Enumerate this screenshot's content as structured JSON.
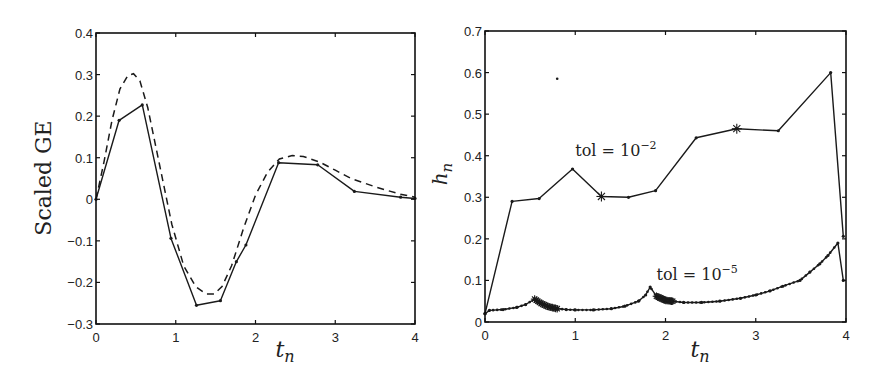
{
  "chart_data": [
    {
      "type": "line",
      "title": "",
      "xlabel": "t_n",
      "ylabel": "Scaled GE",
      "xlim": [
        0,
        4
      ],
      "ylim": [
        -0.3,
        0.4
      ],
      "xticks": [
        0,
        1,
        2,
        3,
        4
      ],
      "yticks": [
        -0.3,
        -0.2,
        -0.1,
        0,
        0.1,
        0.2,
        0.3,
        0.4
      ],
      "xtick_labels": [
        "0",
        "1",
        "2",
        "3",
        "4"
      ],
      "ytick_labels": [
        "−0.3",
        "−0.2",
        "−0.1",
        "0",
        "0.1",
        "0.2",
        "0.3",
        "0.4"
      ],
      "grid": false,
      "legend": null,
      "series": [
        {
          "name": "computed (solid)",
          "style": "solid-with-dots",
          "x": [
            0,
            0.29,
            0.58,
            0.94,
            1.26,
            1.56,
            1.76,
            1.88,
            2.29,
            2.78,
            3.24,
            3.82,
            4.0
          ],
          "y": [
            0.0,
            0.19,
            0.227,
            -0.094,
            -0.255,
            -0.244,
            -0.15,
            -0.11,
            0.088,
            0.083,
            0.019,
            0.005,
            0.002
          ]
        },
        {
          "name": "reference (dashed)",
          "style": "dashed",
          "x": [
            0,
            0.1,
            0.2,
            0.3,
            0.4,
            0.47,
            0.55,
            0.65,
            0.8,
            0.95,
            1.1,
            1.25,
            1.38,
            1.48,
            1.58,
            1.7,
            1.85,
            2.0,
            2.15,
            2.3,
            2.46,
            2.6,
            2.8,
            3.0,
            3.2,
            3.5,
            3.8,
            4.0
          ],
          "y": [
            0.0,
            0.09,
            0.19,
            0.265,
            0.298,
            0.302,
            0.285,
            0.22,
            0.08,
            -0.06,
            -0.16,
            -0.21,
            -0.228,
            -0.228,
            -0.21,
            -0.16,
            -0.07,
            0.01,
            0.065,
            0.097,
            0.105,
            0.103,
            0.09,
            0.07,
            0.05,
            0.03,
            0.013,
            0.005
          ]
        }
      ]
    },
    {
      "type": "line",
      "title": "",
      "xlabel": "t_n",
      "ylabel": "h_n",
      "xlim": [
        0,
        4
      ],
      "ylim": [
        0,
        0.7
      ],
      "xticks": [
        0,
        1,
        2,
        3,
        4
      ],
      "yticks": [
        0,
        0.1,
        0.2,
        0.3,
        0.4,
        0.5,
        0.6,
        0.7
      ],
      "xtick_labels": [
        "0",
        "1",
        "2",
        "3",
        "4"
      ],
      "ytick_labels": [
        "0",
        "0.1",
        "0.2",
        "0.3",
        "0.4",
        "0.5",
        "0.6",
        "0.7"
      ],
      "grid": false,
      "legend": null,
      "annotations": [
        {
          "text": "tol = 10",
          "exp": "−2",
          "x": 1.0,
          "y": 0.4
        },
        {
          "text": "tol = 10",
          "exp": "−5",
          "x": 1.9,
          "y": 0.1
        }
      ],
      "series": [
        {
          "name": "tol = 1e-2",
          "style": "solid-with-dots",
          "x": [
            0,
            0.3,
            0.6,
            0.97,
            1.29,
            1.59,
            1.89,
            2.34,
            2.79,
            3.25,
            3.83,
            3.97
          ],
          "y": [
            0.02,
            0.29,
            0.297,
            0.368,
            0.302,
            0.3,
            0.316,
            0.443,
            0.465,
            0.46,
            0.6,
            0.206
          ],
          "rejected_steps_at": [
            1.29,
            2.79
          ]
        },
        {
          "name": "tol = 1e-5",
          "style": "solid-with-dots",
          "x": [
            0,
            0.05,
            0.2,
            0.35,
            0.45,
            0.55,
            0.62,
            0.7,
            0.8,
            0.9,
            1.0,
            1.2,
            1.4,
            1.55,
            1.7,
            1.78,
            1.83,
            1.9,
            2.0,
            2.08,
            2.2,
            2.4,
            2.6,
            2.83,
            3.0,
            3.16,
            3.3,
            3.49,
            3.6,
            3.71,
            3.8,
            3.91,
            3.97
          ],
          "y": [
            0.02,
            0.028,
            0.03,
            0.035,
            0.042,
            0.055,
            0.045,
            0.037,
            0.032,
            0.03,
            0.029,
            0.029,
            0.032,
            0.038,
            0.05,
            0.065,
            0.084,
            0.062,
            0.052,
            0.05,
            0.047,
            0.047,
            0.05,
            0.057,
            0.065,
            0.075,
            0.086,
            0.1,
            0.12,
            0.14,
            0.16,
            0.19,
            0.1
          ],
          "rejected_clusters": [
            [
              0.55,
              0.8
            ],
            [
              1.9,
              2.08
            ]
          ]
        }
      ],
      "stray_points": [
        {
          "x": 0.8,
          "y": 0.585
        }
      ]
    }
  ]
}
